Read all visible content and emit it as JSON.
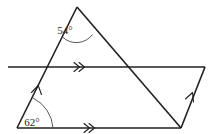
{
  "figure": {
    "stroke_color": "#231f20",
    "arc_color": "#5a5557",
    "background_color": "#ffffff",
    "angles": [
      {
        "id": "apex-angle",
        "label": "54°",
        "value": 54,
        "unit": "degrees",
        "vertex": "apex",
        "position": {
          "x": 77,
          "y": 7
        },
        "label_position": {
          "x": 65,
          "y": 36
        }
      },
      {
        "id": "bottom-left-angle",
        "label": "62°",
        "value": 62,
        "unit": "degrees",
        "vertex": "bottom-left",
        "position": {
          "x": 17,
          "y": 128
        },
        "label_position": {
          "x": 19,
          "y": 126
        }
      }
    ],
    "vertices": {
      "apex": {
        "x": 77,
        "y": 7
      },
      "bottom_left": {
        "x": 17,
        "y": 128
      },
      "bottom_right": {
        "x": 181,
        "y": 128
      },
      "mid_line_left": {
        "x": 8,
        "y": 67
      },
      "mid_line_right": {
        "x": 205,
        "y": 67
      }
    },
    "segments": [
      {
        "id": "left-slant",
        "from": "apex",
        "to": "bottom_left",
        "marks": 1
      },
      {
        "id": "right-slant",
        "from": "apex",
        "to": "bottom_right",
        "marks": 0
      },
      {
        "id": "middle-horizontal",
        "from": "mid_line_left",
        "to": "mid_line_right",
        "marks": 2
      },
      {
        "id": "bottom-horizontal",
        "from": "bottom_left",
        "to": "bottom_right",
        "marks": 2
      },
      {
        "id": "right-slant-up",
        "from": "bottom_right",
        "to": "mid_line_right",
        "marks": 1
      }
    ],
    "marks": {
      "single_arrow_note": "single chevron indicates one set of parallel lines",
      "double_arrow_note": "double chevron indicates second set of parallel lines"
    }
  }
}
